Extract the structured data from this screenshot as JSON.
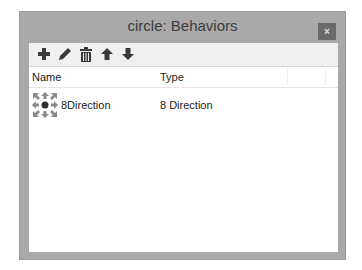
{
  "window": {
    "title": "circle: Behaviors",
    "close_label": "×"
  },
  "toolbar": {
    "buttons": [
      {
        "name": "add",
        "icon": "plus-icon"
      },
      {
        "name": "edit",
        "icon": "pencil-icon"
      },
      {
        "name": "delete",
        "icon": "trash-icon"
      },
      {
        "name": "move-up",
        "icon": "arrow-up-icon"
      },
      {
        "name": "move-down",
        "icon": "arrow-down-icon"
      }
    ]
  },
  "list": {
    "columns": [
      "Name",
      "Type"
    ],
    "rows": [
      {
        "icon": "eight-direction-icon",
        "name": "8Direction",
        "type": "8 Direction"
      }
    ]
  },
  "colors": {
    "frame": "#a9a9a9",
    "close_button": "#6a6a6a",
    "toolbar_bg": "#f0f0f0",
    "icon_dark": "#3a3a3a",
    "icon_gray": "#8a8a8a"
  }
}
